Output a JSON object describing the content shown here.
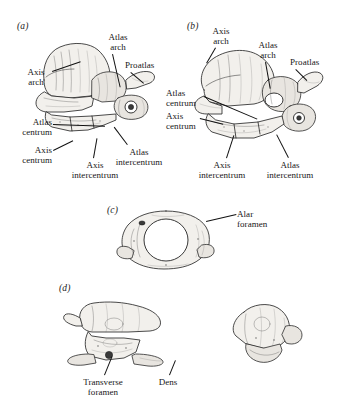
{
  "figure": {
    "kind": "anatomical-illustration-plate",
    "background_color": "#ffffff",
    "ink_color": "#161616",
    "bone_fill_color": "#f2f0ec"
  },
  "panels": [
    {
      "id": "a",
      "letter": "(a)",
      "view": "lateral view of atlas-axis complex",
      "labels": [
        {
          "key": "axis_arch",
          "text": "Axis\narch",
          "line1": "Axis",
          "line2": "arch"
        },
        {
          "key": "atlas_arch",
          "text": "Atlas\narch",
          "line1": "Atlas",
          "line2": "arch"
        },
        {
          "key": "proatlas",
          "text": "Proatlas",
          "line1": "Proatlas",
          "line2": ""
        },
        {
          "key": "atlas_centrum",
          "text": "Atlas\ncentrum",
          "line1": "Atlas",
          "line2": "centrum"
        },
        {
          "key": "axis_centrum",
          "text": "Axis\ncentrum",
          "line1": "Axis",
          "line2": "centrum"
        },
        {
          "key": "axis_intercentrum",
          "text": "Axis\nintercentrum",
          "line1": "Axis",
          "line2": "intercentrum"
        },
        {
          "key": "atlas_intercentrum",
          "text": "Atlas\nintercentrum",
          "line1": "Atlas",
          "line2": "intercentrum"
        }
      ]
    },
    {
      "id": "b",
      "letter": "(b)",
      "view": "oblique view of atlas-axis complex",
      "labels": [
        {
          "key": "axis_arch",
          "text": "Axis\narch",
          "line1": "Axis",
          "line2": "arch"
        },
        {
          "key": "atlas_arch",
          "text": "Atlas\narch",
          "line1": "Atlas",
          "line2": "arch"
        },
        {
          "key": "proatlas",
          "text": "Proatlas",
          "line1": "Proatlas",
          "line2": ""
        },
        {
          "key": "atlas_centrum",
          "text": "Atlas\ncentrum",
          "line1": "Atlas",
          "line2": "centrum"
        },
        {
          "key": "axis_centrum",
          "text": "Axis\ncentrum",
          "line1": "Axis",
          "line2": "centrum"
        },
        {
          "key": "axis_intercentrum",
          "text": "Axis\nintercentrum",
          "line1": "Axis",
          "line2": "intercentrum"
        },
        {
          "key": "atlas_intercentrum",
          "text": "Atlas\nintercentrum",
          "line1": "Atlas",
          "line2": "intercentrum"
        }
      ]
    },
    {
      "id": "c",
      "letter": "(c)",
      "view": "anterior view of atlas ring",
      "labels": [
        {
          "key": "alar_foramen",
          "text": "Alar\nforamen",
          "line1": "Alar",
          "line2": "foramen"
        }
      ]
    },
    {
      "id": "d",
      "letter": "(d)",
      "view": "axis vertebra, lateral and anterior views",
      "labels": [
        {
          "key": "transverse_foramen",
          "text": "Transverse\nforamen",
          "line1": "Transverse",
          "line2": "foramen"
        },
        {
          "key": "dens",
          "text": "Dens",
          "line1": "Dens",
          "line2": ""
        }
      ]
    }
  ]
}
